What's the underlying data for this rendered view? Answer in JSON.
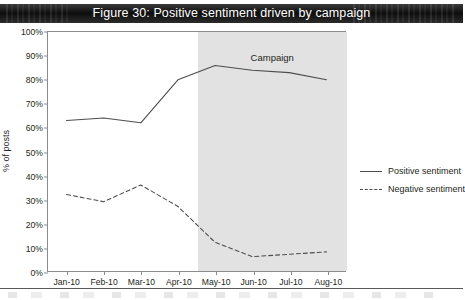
{
  "title": "Figure 30: Positive sentiment driven by campaign",
  "chart_data": {
    "type": "line",
    "title": "Figure 30: Positive sentiment driven by campaign",
    "xlabel": "",
    "ylabel": "% of posts",
    "categories": [
      "Jan-10",
      "Feb-10",
      "Mar-10",
      "Apr-10",
      "May-10",
      "Jun-10",
      "Jul-10",
      "Aug-10"
    ],
    "ylim": [
      0,
      100
    ],
    "yticks": [
      "0%",
      "10%",
      "20%",
      "30%",
      "40%",
      "50%",
      "60%",
      "70%",
      "80%",
      "90%",
      "100%"
    ],
    "ytick_values": [
      0,
      10,
      20,
      30,
      40,
      50,
      60,
      70,
      80,
      90,
      100
    ],
    "grid": false,
    "legend_position": "right",
    "series": [
      {
        "name": "Positive sentiment",
        "style": "solid",
        "color": "#4d4d4d",
        "values": [
          63,
          64,
          62,
          80,
          86,
          84,
          83,
          80
        ]
      },
      {
        "name": "Negative sentiment",
        "style": "dashed",
        "color": "#4d4d4d",
        "values": [
          32,
          29,
          36,
          27,
          12,
          6,
          7,
          8
        ]
      }
    ],
    "annotations": [
      {
        "label": "Campaign",
        "type": "shaded-band",
        "from": "May-10",
        "to": "Aug-10",
        "color": "#e2e2e2"
      }
    ]
  },
  "legend": [
    {
      "label": "Positive sentiment",
      "style": "solid"
    },
    {
      "label": "Negative sentiment",
      "style": "dashed"
    }
  ],
  "campaign_label": "Campaign"
}
